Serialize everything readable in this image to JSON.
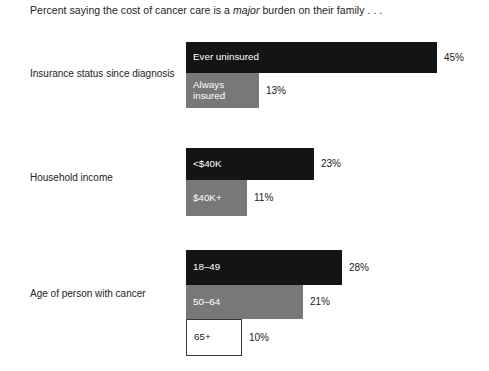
{
  "chart_data": {
    "type": "bar",
    "title_prefix": "Percent saying the cost of cancer care is a ",
    "title_emphasis": "major",
    "title_suffix": " burden on their family . . .",
    "title": "Percent saying the cost of cancer care is a major burden on their family . . .",
    "xlabel": "",
    "ylabel": "",
    "xlim": [
      0,
      45
    ],
    "grid": false,
    "legend": "none",
    "orientation": "horizontal",
    "units": "percent",
    "groups": [
      {
        "category": "Insurance status since diagnosis",
        "bars": [
          {
            "label": "Ever uninsured",
            "value": 45,
            "value_label": "45%",
            "style": "dark"
          },
          {
            "label": "Always\ninsured",
            "value": 13,
            "value_label": "13%",
            "style": "gray"
          }
        ]
      },
      {
        "category": "Household income",
        "bars": [
          {
            "label": "<$40K",
            "value": 23,
            "value_label": "23%",
            "style": "dark"
          },
          {
            "label": "$40K+",
            "value": 11,
            "value_label": "11%",
            "style": "gray"
          }
        ]
      },
      {
        "category": "Age of person with cancer",
        "bars": [
          {
            "label": "18–49",
            "value": 28,
            "value_label": "28%",
            "style": "dark"
          },
          {
            "label": "50–64",
            "value": 21,
            "value_label": "21%",
            "style": "gray"
          },
          {
            "label": "65+",
            "value": 10,
            "value_label": "10%",
            "style": "white"
          }
        ]
      }
    ]
  },
  "colors": {
    "dark_bar": "#141414",
    "gray_bar": "#787878",
    "white_bar": "#ffffff",
    "background": "#ffffff",
    "text": "#1a1a1a"
  }
}
